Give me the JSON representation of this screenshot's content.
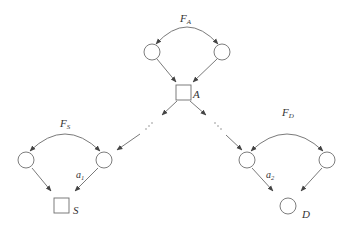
{
  "diagram": {
    "top_group": {
      "label_main": "F",
      "label_sub": "A",
      "sink_label": "A"
    },
    "left_group": {
      "label_main": "F",
      "label_sub": "S",
      "edge_label_main": "a",
      "edge_label_sub": "1",
      "sink_label": "S"
    },
    "right_group": {
      "label_main": "F",
      "label_sub": "D",
      "edge_label_main": "a",
      "edge_label_sub": "2",
      "sink_label": "D"
    },
    "ellipsis_left": "⋰",
    "ellipsis_right": "⋱",
    "colors": {
      "stroke": "#7a7a7a",
      "node_stroke": "#6e6e6e",
      "text": "#333333",
      "background": "#ffffff"
    }
  }
}
